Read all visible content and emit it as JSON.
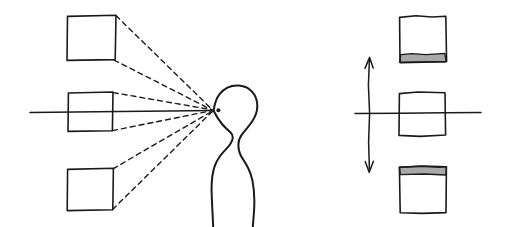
{
  "figure": {
    "title": "Perspective projection of three squares onto an eye, and the resulting retinal images",
    "style": "hand-drawn line art",
    "background_color": "#ffffff",
    "ink_color": "#1a1a1a",
    "shade_color": "#a8a8a8",
    "canvas": {
      "width": 508,
      "height": 227
    }
  },
  "left_panel": {
    "name": "object-space-with-observer",
    "sight_line": {
      "label": "line of sight",
      "x1": 30,
      "y1": 112,
      "x2": 214,
      "y2": 110
    },
    "squares": [
      {
        "label": "upper square",
        "position": "above eye level",
        "x": 67,
        "y": 15,
        "width": 49,
        "height": 45
      },
      {
        "label": "middle square",
        "position": "at eye level",
        "x": 68,
        "y": 92,
        "width": 45,
        "height": 39
      },
      {
        "label": "lower square",
        "position": "below eye level",
        "x": 67,
        "y": 168,
        "width": 46,
        "height": 42
      }
    ],
    "rays": {
      "label": "sight rays",
      "style": "dashed",
      "count": 6,
      "converge_at": {
        "x": 213,
        "y": 110
      }
    },
    "observer": {
      "label": "observer head in profile facing left",
      "eye": {
        "x": 218,
        "y": 110,
        "r": 2.0
      }
    }
  },
  "right_panel": {
    "name": "projected-image-space",
    "axes": {
      "horizontal": {
        "label": "horizon line",
        "x1": 355,
        "y1": 113,
        "x2": 481,
        "y2": 113
      },
      "vertical": {
        "label": "vertical double-headed arrow",
        "x": 369,
        "y_top": 58,
        "y_bottom": 171,
        "arrowheads": "both ends"
      }
    },
    "squares": [
      {
        "label": "upper projected square",
        "position": "above horizon",
        "shaded_band": "bottom",
        "x": 399,
        "y": 16,
        "width": 47,
        "height": 45
      },
      {
        "label": "middle projected square",
        "position": "on horizon",
        "shaded_band": "none",
        "x": 399,
        "y": 92,
        "width": 46,
        "height": 44
      },
      {
        "label": "lower projected square",
        "position": "below horizon",
        "shaded_band": "top",
        "x": 399,
        "y": 166,
        "width": 47,
        "height": 47
      }
    ]
  }
}
